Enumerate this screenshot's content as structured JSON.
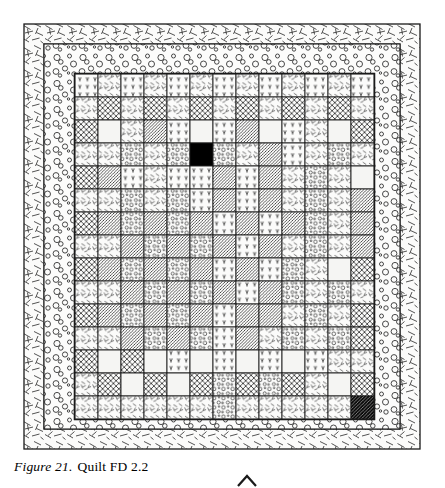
{
  "figure": {
    "label": "Figure 21.",
    "title": "Quilt FD 2.2",
    "caption_full": "Figure 21.  Quilt FD 2.2"
  },
  "colors": {
    "ink": "#1a1a1a",
    "paper": "#ffffff",
    "solid_black": "#000000",
    "light_fill": "#f4f4f2"
  },
  "layout": {
    "canvas_width": 445,
    "canvas_height": 488,
    "outer_frame": {
      "x": 24,
      "y": 24,
      "width": 396,
      "height": 425
    },
    "dash_border_band_width": 20,
    "circle_border_band_width": 22,
    "grid": {
      "x": 75,
      "y": 74,
      "width": 299,
      "height": 345,
      "columns": 13,
      "rows": 15,
      "cell_width": 23,
      "cell_height": 23
    }
  },
  "legend_patterns": [
    {
      "key": "sprig",
      "name": "sprig-print"
    },
    {
      "key": "stick",
      "name": "stick-print"
    },
    {
      "key": "crosshatch",
      "name": "crosshatch-print"
    },
    {
      "key": "diag",
      "name": "diagonal-stripe-print"
    },
    {
      "key": "ring",
      "name": "ring-dot-print"
    },
    {
      "key": "plain",
      "name": "plain-muslin"
    },
    {
      "key": "black",
      "name": "solid-black-patch"
    },
    {
      "key": "darkdiag",
      "name": "dark-diagonal-patch"
    }
  ],
  "quilt_grid": {
    "columns": 13,
    "rows": 15,
    "cells": [
      [
        "sprig",
        "stick",
        "sprig",
        "stick",
        "sprig",
        "stick",
        "sprig",
        "stick",
        "sprig",
        "stick",
        "sprig",
        "stick",
        "sprig"
      ],
      [
        "stick",
        "crosshatch",
        "stick",
        "crosshatch",
        "stick",
        "crosshatch",
        "stick",
        "crosshatch",
        "stick",
        "crosshatch",
        "stick",
        "crosshatch",
        "stick"
      ],
      [
        "crosshatch",
        "plain",
        "stick",
        "diag",
        "sprig",
        "plain",
        "sprig",
        "diag",
        "plain",
        "sprig",
        "stick",
        "plain",
        "crosshatch"
      ],
      [
        "stick",
        "stick",
        "ring",
        "stick",
        "ring",
        "black",
        "ring",
        "stick",
        "diag",
        "sprig",
        "stick",
        "ring",
        "stick"
      ],
      [
        "crosshatch",
        "diag",
        "sprig",
        "stick",
        "sprig",
        "sprig",
        "diag",
        "sprig",
        "diag",
        "stick",
        "ring",
        "stick",
        "plain"
      ],
      [
        "stick",
        "stick",
        "ring",
        "stick",
        "ring",
        "sprig",
        "diag",
        "sprig",
        "diag",
        "stick",
        "ring",
        "stick",
        "diag"
      ],
      [
        "crosshatch",
        "diag",
        "ring",
        "diag",
        "ring",
        "diag",
        "sprig",
        "diag",
        "sprig",
        "diag",
        "ring",
        "stick",
        "diag"
      ],
      [
        "stick",
        "stick",
        "diag",
        "ring",
        "diag",
        "ring",
        "diag",
        "sprig",
        "diag",
        "stick",
        "ring",
        "stick",
        "diag"
      ],
      [
        "crosshatch",
        "diag",
        "ring",
        "diag",
        "ring",
        "diag",
        "sprig",
        "diag",
        "sprig",
        "ring",
        "stick",
        "plain",
        "crosshatch"
      ],
      [
        "stick",
        "stick",
        "diag",
        "ring",
        "diag",
        "ring",
        "diag",
        "sprig",
        "diag",
        "ring",
        "stick",
        "ring",
        "stick"
      ],
      [
        "crosshatch",
        "diag",
        "ring",
        "diag",
        "ring",
        "diag",
        "sprig",
        "diag",
        "diag",
        "stick",
        "ring",
        "stick",
        "crosshatch"
      ],
      [
        "stick",
        "stick",
        "diag",
        "ring",
        "diag",
        "ring",
        "sprig",
        "diag",
        "stick",
        "ring",
        "stick",
        "ring",
        "crosshatch"
      ],
      [
        "crosshatch",
        "plain",
        "crosshatch",
        "plain",
        "sprig",
        "plain",
        "sprig",
        "plain",
        "sprig",
        "plain",
        "sprig",
        "stick",
        "stick"
      ],
      [
        "stick",
        "crosshatch",
        "plain",
        "crosshatch",
        "plain",
        "crosshatch",
        "ring",
        "crosshatch",
        "ring",
        "crosshatch",
        "stick",
        "plain",
        "crosshatch"
      ],
      [
        "stick",
        "stick",
        "stick",
        "stick",
        "stick",
        "stick",
        "ring",
        "stick",
        "stick",
        "stick",
        "stick",
        "stick",
        "darkdiag"
      ]
    ]
  },
  "marks": {
    "bottom_caret": {
      "x": 247,
      "y": 477,
      "name": "registration-caret"
    }
  }
}
